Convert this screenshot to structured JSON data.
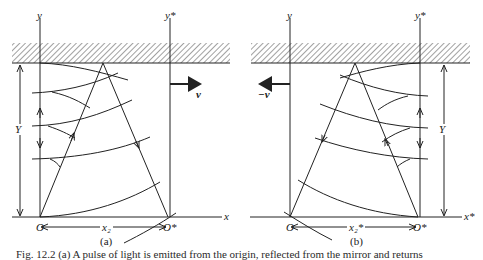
{
  "figure": {
    "panel_a": {
      "label": "(a)",
      "axis_y": "y",
      "axis_y_star": "y*",
      "axis_x": "x",
      "origin": "O",
      "origin_star": "O*",
      "height_label": "Y",
      "velocity_label": "v",
      "distance_label": "x₂"
    },
    "panel_b": {
      "label": "(b)",
      "axis_y": "y",
      "axis_y_star": "y*",
      "axis_x_star": "x*",
      "origin": "O",
      "origin_star": "O*",
      "height_label": "Y",
      "velocity_label": "−v",
      "distance_label": "x₂*"
    },
    "caption": "Fig. 12.2 (a) A pulse of light is emitted from the origin, reflected from the mirror and returns"
  }
}
